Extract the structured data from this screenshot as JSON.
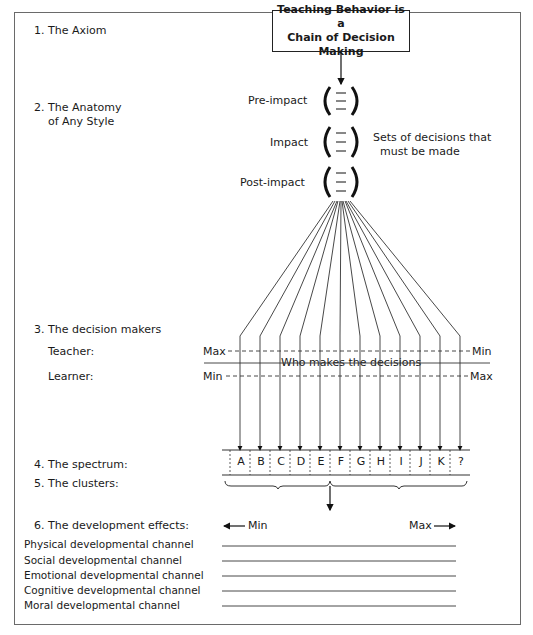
{
  "frame": {
    "border_color": "#6a6a6a"
  },
  "sections": {
    "axiom": {
      "label": "1. The Axiom",
      "box_line1": "Teaching Behavior is a",
      "box_line2": "Chain of Decision Making"
    },
    "anatomy": {
      "label_line1": "2. The Anatomy",
      "label_line2": "of Any Style",
      "sets": [
        {
          "label": "Pre-impact"
        },
        {
          "label": "Impact"
        },
        {
          "label": "Post-impact"
        }
      ],
      "note_line1": "Sets of decisions that",
      "note_line2": "must be made"
    },
    "decision_makers": {
      "label": "3. The decision makers",
      "teacher_label": "Teacher:",
      "learner_label": "Learner:",
      "teacher_left": "Max",
      "teacher_right": "Min",
      "learner_left": "Min",
      "learner_right": "Max",
      "center_caption": "Who makes the decisions"
    },
    "spectrum": {
      "label": "4. The spectrum:",
      "styles": [
        "A",
        "B",
        "C",
        "D",
        "E",
        "F",
        "G",
        "H",
        "I",
        "J",
        "K",
        "?"
      ]
    },
    "clusters": {
      "label": "5. The clusters:"
    },
    "development": {
      "label": "6. The development effects:",
      "min_label": "Min",
      "max_label": "Max",
      "channels": [
        "Physical developmental channel",
        "Social developmental channel",
        "Emotional developmental channel",
        "Cognitive developmental channel",
        "Moral developmental channel"
      ]
    }
  }
}
